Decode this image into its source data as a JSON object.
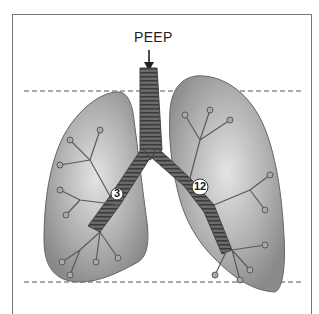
{
  "diagram": {
    "title_label": "PEEP",
    "markers": [
      {
        "id": "left-bronchus",
        "value": "3"
      },
      {
        "id": "right-bronchus",
        "value": "12"
      }
    ],
    "colors": {
      "lung_fill": "#9a9a9a",
      "lung_light": "#d8d8d8",
      "airway": "#555555",
      "frame": "#777777",
      "dashed_line": "#555555"
    },
    "reference_lines": [
      "upper-dashed-line",
      "lower-dashed-line"
    ]
  }
}
